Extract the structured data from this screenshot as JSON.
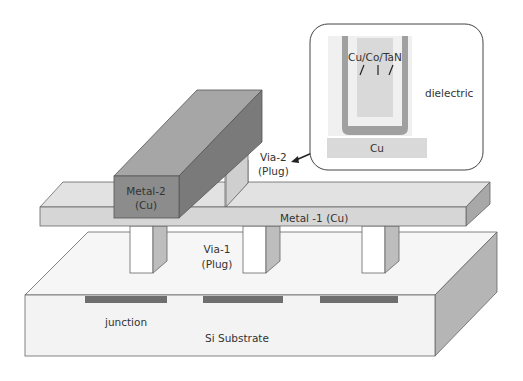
{
  "diagram": {
    "labels": {
      "metal2_line1": "Metal-2",
      "metal2_line2": "(Cu)",
      "via2_line1": "Via-2",
      "via2_line2": "(Plug)",
      "metal1": "Metal -1 (Cu)",
      "via1_line1": "Via-1",
      "via1_line2": "(Plug)",
      "junction": "junction",
      "substrate": "Si Substrate"
    },
    "inset": {
      "layers": "Cu/Co/TaN",
      "dielectric": "dielectric",
      "cu_base": "Cu"
    },
    "colors": {
      "metal2_front": "#8c8c8c",
      "metal2_top": "#a6a6a6",
      "metal2_side": "#7a7a7a",
      "metal1_top": "#e2e2e2",
      "metal1_front": "#d6d6d6",
      "metal1_side": "#a8a8a8",
      "substrate_top": "#f6f6f6",
      "substrate_front": "#f3f3f3",
      "substrate_side": "#b5b5b5",
      "junction": "#6e6e6e",
      "via_front": "#ffffff",
      "via_side": "#bdbdbd",
      "liner": "#a0a0a0",
      "cu_fill": "#d9d9d9",
      "dielectric_bg": "#f0f0f0"
    }
  }
}
